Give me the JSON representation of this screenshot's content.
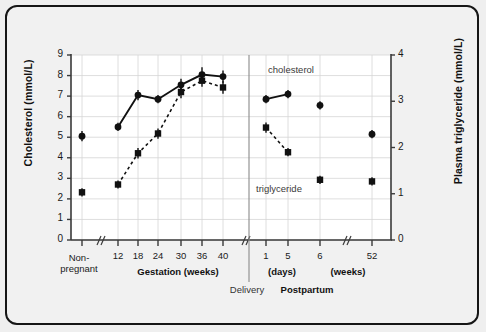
{
  "chart_data": {
    "type": "line",
    "title": "",
    "xlabel": "",
    "ylabel": "Cholesterol (mmol/L)",
    "y2label": "Plasma triglyceride (mmol/L)",
    "ylim": [
      0,
      9
    ],
    "y2lim": [
      0,
      4
    ],
    "yticks": [
      "0",
      "1",
      "2",
      "3",
      "4",
      "5",
      "6",
      "7",
      "8",
      "9"
    ],
    "y2ticks": [
      "0",
      "1",
      "2",
      "3",
      "4"
    ],
    "grid": true,
    "legend_position": "inline-annotation",
    "categories": [
      "Non-pregnant",
      "12",
      "18",
      "24",
      "30",
      "36",
      "40",
      "1",
      "5",
      "6",
      "52"
    ],
    "x_tick_labels": [
      "",
      "12",
      "18",
      "24",
      "30",
      "36",
      "40",
      "1",
      "5",
      "6",
      "52"
    ],
    "x_axis_breaks": [
      "after Non-pregnant",
      "after 40 (Delivery)",
      "after 6"
    ],
    "x_group_labels": [
      {
        "text": "Gestation (weeks)",
        "bold": true
      },
      {
        "text": "(days)",
        "bold": true
      },
      {
        "text": "(weeks)",
        "bold": true
      },
      {
        "text": "Postpartum",
        "bold": true
      },
      {
        "text": "Delivery",
        "bold": false
      }
    ],
    "non_pregnant_label_line1": "Non-",
    "non_pregnant_label_line2": "pregnant",
    "series": [
      {
        "name": "cholesterol",
        "axis": "left",
        "marker": "circle",
        "line": "solid",
        "units": "mmol/L",
        "values": [
          5.05,
          5.5,
          7.05,
          6.85,
          7.55,
          8.05,
          7.95,
          6.85,
          7.1,
          6.55,
          5.15
        ],
        "errors": [
          0.25,
          0.2,
          0.25,
          0.2,
          0.3,
          0.35,
          0.3,
          0.2,
          0.2,
          0.2,
          0.2
        ],
        "connected_segments": [
          [
            1,
            2,
            3,
            4,
            5,
            6
          ],
          [
            7,
            8
          ]
        ]
      },
      {
        "name": "triglyceride",
        "axis": "right",
        "marker": "square",
        "line": "dashed",
        "units": "mmol/L",
        "values_right_axis": [
          1.03,
          1.2,
          1.88,
          2.3,
          3.2,
          3.45,
          3.3,
          2.43,
          1.9,
          1.3,
          1.27
        ],
        "values_on_left_scale": [
          2.32,
          2.7,
          4.22,
          5.18,
          7.2,
          7.75,
          7.42,
          5.47,
          4.27,
          2.93,
          2.85
        ],
        "errors": [
          0.2,
          0.2,
          0.25,
          0.25,
          0.3,
          0.3,
          0.3,
          0.25,
          0.2,
          0.2,
          0.2
        ],
        "connected_segments": [
          [
            1,
            2,
            3,
            4,
            5,
            6
          ],
          [
            7,
            8
          ]
        ]
      }
    ],
    "annotations": [
      {
        "text": "cholesterol",
        "x_category": "5",
        "note": "upper series label"
      },
      {
        "text": "triglyceride",
        "x_category": "5",
        "note": "lower series label"
      }
    ]
  }
}
